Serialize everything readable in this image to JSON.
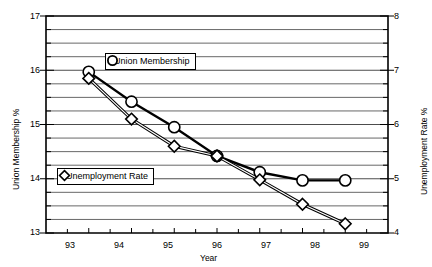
{
  "chart_data": {
    "type": "line",
    "title": "",
    "xlabel": "Year",
    "ylabel": "Union Membership %",
    "y2label": "Unemployment Rate %",
    "categories": [
      "93",
      "94",
      "95",
      "96",
      "97",
      "98",
      "99"
    ],
    "x": [
      93,
      94,
      95,
      96,
      97,
      98,
      99
    ],
    "ylim": [
      13,
      17
    ],
    "y2lim": [
      4,
      8
    ],
    "yticks": [
      "13",
      "14",
      "15",
      "16",
      "17"
    ],
    "y2ticks": [
      "4",
      "5",
      "6",
      "7",
      "8"
    ],
    "grid": true,
    "grid_interval": 0.25,
    "legend_position": "inside",
    "series": [
      {
        "name": "Union Membership",
        "axis": "left",
        "marker": "circle",
        "values": [
          15.97,
          15.42,
          14.95,
          14.42,
          14.12,
          13.97,
          13.97
        ]
      },
      {
        "name": "Unemployment Rate",
        "axis": "right",
        "marker": "diamond",
        "values": [
          6.85,
          6.1,
          5.6,
          5.42,
          4.98,
          4.53,
          4.17
        ]
      }
    ]
  },
  "axes": {
    "x_title": "Year",
    "y_left_title": "Union Membership %",
    "y_right_title": "Unemployment Rate %"
  },
  "legend": {
    "items": [
      {
        "label": "Union Membership",
        "marker": "circle-marker-icon"
      },
      {
        "label": "Unemployment Rate",
        "marker": "diamond-marker-icon"
      }
    ]
  },
  "colors": {
    "ink": "#000000",
    "background": "#ffffff"
  }
}
